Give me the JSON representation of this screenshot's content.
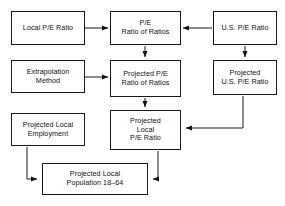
{
  "diagram": {
    "type": "flowchart",
    "background_color": "#ffffff",
    "line_color": "#1a1a1a",
    "text_color": "#111111",
    "nodes": [
      {
        "id": "local_pe_ratio",
        "label": "Local P/E Ratio",
        "x": 11,
        "y": 11,
        "w": 74,
        "h": 34,
        "row": 1,
        "col": "left"
      },
      {
        "id": "pe_ratio_of_ratios",
        "label": "P/E\nRatio of Ratios",
        "x": 110,
        "y": 11,
        "w": 71,
        "h": 34,
        "row": 1,
        "col": "center"
      },
      {
        "id": "us_pe_ratio",
        "label": "U.S. P/E Ratio",
        "x": 213,
        "y": 11,
        "w": 64,
        "h": 34,
        "row": 1,
        "col": "right"
      },
      {
        "id": "extrapolation_method",
        "label": "Extrapolation\nMethod",
        "x": 11,
        "y": 60,
        "w": 74,
        "h": 33,
        "row": 2,
        "col": "left"
      },
      {
        "id": "projected_pe_ratio_of_ratios",
        "label": "Projected P/E\nRatio of Ratios",
        "x": 110,
        "y": 60,
        "w": 71,
        "h": 37,
        "row": 2,
        "col": "center"
      },
      {
        "id": "projected_us_pe_ratio",
        "label": "Projected\nU.S. P/E Ratio",
        "x": 213,
        "y": 60,
        "w": 64,
        "h": 35,
        "row": 2,
        "col": "right"
      },
      {
        "id": "projected_local_employment",
        "label": "Projected Local\nEmployment",
        "x": 11,
        "y": 113,
        "w": 74,
        "h": 33,
        "row": 3,
        "col": "left"
      },
      {
        "id": "projected_local_pe_ratio",
        "label": "Projected\nLocal\nP/E Ratio",
        "x": 110,
        "y": 110,
        "w": 71,
        "h": 40,
        "row": 3,
        "col": "center"
      },
      {
        "id": "projected_local_population",
        "label": "Projected Local\nPopulation 18–64",
        "x": 42,
        "y": 163,
        "w": 106,
        "h": 32,
        "row": 4,
        "col": "center"
      }
    ],
    "edges": [
      {
        "id": "edge-local-to-ratio-of-ratios",
        "from": "local_pe_ratio",
        "to": "pe_ratio_of_ratios",
        "direction": "right",
        "path": "M 85 28 L 108 28",
        "arrow_at": [
          108,
          28
        ],
        "arrow_dir": "right"
      },
      {
        "id": "edge-us-to-ratio-of-ratios",
        "from": "us_pe_ratio",
        "to": "pe_ratio_of_ratios",
        "direction": "left",
        "path": "M 212 28 L 183 28",
        "arrow_at": [
          183,
          28
        ],
        "arrow_dir": "left"
      },
      {
        "id": "edge-ratio-of-ratios-to-projected",
        "from": "pe_ratio_of_ratios",
        "to": "projected_pe_ratio_of_ratios",
        "direction": "down",
        "path": "M 145 46 L 145 57",
        "arrow_at": [
          145,
          57
        ],
        "arrow_dir": "down"
      },
      {
        "id": "edge-extrapolation-to-projected-ratio",
        "from": "extrapolation_method",
        "to": "projected_pe_ratio_of_ratios",
        "direction": "right",
        "path": "M 85 77 L 108 77",
        "arrow_at": [
          108,
          77
        ],
        "arrow_dir": "right"
      },
      {
        "id": "edge-us-to-projected-us",
        "from": "us_pe_ratio",
        "to": "projected_us_pe_ratio",
        "direction": "down",
        "path": "M 245 46 L 245 57",
        "arrow_at": [
          245,
          57
        ],
        "arrow_dir": "down"
      },
      {
        "id": "edge-projected-ratio-to-local-ratio",
        "from": "projected_pe_ratio_of_ratios",
        "to": "projected_local_pe_ratio",
        "direction": "down",
        "path": "M 145 98 L 145 107",
        "arrow_at": [
          145,
          107
        ],
        "arrow_dir": "down"
      },
      {
        "id": "edge-projected-us-to-local-ratio",
        "from": "projected_us_pe_ratio",
        "to": "projected_local_pe_ratio",
        "direction": "elbow-down-left",
        "path": "M 243 96 L 243 128 L 186 128",
        "arrow_at": [
          183,
          128
        ],
        "arrow_dir": "left"
      },
      {
        "id": "edge-employment-to-population",
        "from": "projected_local_employment",
        "to": "projected_local_population",
        "direction": "elbow-down-right",
        "path": "M 27 147 L 27 179 L 37 179",
        "arrow_at": [
          40,
          179
        ],
        "arrow_dir": "right"
      },
      {
        "id": "edge-local-ratio-to-population",
        "from": "projected_local_pe_ratio",
        "to": "projected_local_population",
        "direction": "elbow-down-left",
        "path": "M 158 151 L 158 179 L 153 179",
        "arrow_at": [
          150,
          179
        ],
        "arrow_dir": "left"
      }
    ]
  }
}
